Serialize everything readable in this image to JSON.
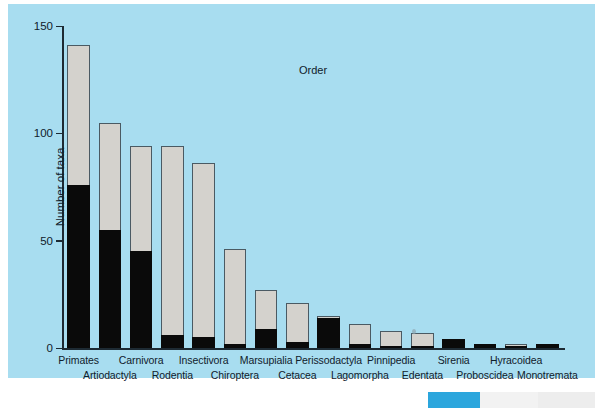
{
  "figure": {
    "background_color": "#a8ddf0",
    "page_color": "#ffffff",
    "bar_fill_color": "#d4d2cd",
    "bar_black_color": "#0a0a0a",
    "bar_outline_color": "#4a5a63",
    "axis_color": "#1d2a33"
  },
  "chart_data": {
    "type": "bar",
    "title": "",
    "subtitle": "",
    "xlabel": "Order",
    "ylabel": "Number of taxa",
    "ylim": [
      0,
      150
    ],
    "yticks": [
      0,
      50,
      100,
      150
    ],
    "ytick_labels": [
      "0",
      "50",
      "100",
      "150"
    ],
    "grid": false,
    "legend_position": "none",
    "stacked": true,
    "categories": [
      "Primates",
      "Artiodactyla",
      "Carnivora",
      "Rodentia",
      "Insectivora",
      "Chiroptera",
      "Marsupialia",
      "Cetacea",
      "Perissodactyla",
      "Lagomorpha",
      "Pinnipedia",
      "Edentata",
      "Sirenia",
      "Proboscidea",
      "Hyracoidea",
      "Monotremata"
    ],
    "series": [
      {
        "name": "black",
        "values": [
          76,
          55,
          45,
          6,
          5,
          2,
          9,
          3,
          14,
          2,
          1,
          1,
          4,
          2,
          1,
          2
        ]
      },
      {
        "name": "grey",
        "values": [
          65,
          50,
          49,
          88,
          81,
          44,
          18,
          18,
          1,
          9,
          7,
          6,
          0,
          0,
          1,
          0
        ]
      }
    ],
    "totals": [
      141,
      105,
      94,
      94,
      86,
      46,
      27,
      21,
      15,
      11,
      8,
      7,
      4,
      2,
      2,
      2
    ],
    "label_rows": [
      0,
      1,
      0,
      1,
      0,
      1,
      0,
      1,
      0,
      1,
      0,
      1,
      0,
      1,
      0,
      1
    ]
  },
  "artifact": {
    "swatches": [
      {
        "color": "#2ba6dd",
        "width": 52
      },
      {
        "color": "#f2f2f2",
        "width": 58
      },
      {
        "color": "#ededed",
        "width": 57
      }
    ]
  }
}
